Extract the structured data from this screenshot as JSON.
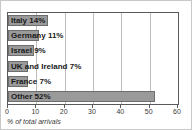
{
  "chart_data": {
    "type": "bar",
    "orientation": "horizontal",
    "title": "",
    "xlabel": "% of total arrivals",
    "ylabel": "",
    "xlim": [
      0,
      60
    ],
    "ylim": null,
    "grid": true,
    "legend": false,
    "categories": [
      "Italy",
      "Germany",
      "Israel",
      "UK and Ireland",
      "France",
      "Other"
    ],
    "values": [
      14,
      11,
      9,
      7,
      7,
      52
    ],
    "data_labels": [
      "Italy 14%",
      "Germany 11%",
      "Israel 9%",
      "UK and Ireland 7%",
      "France 7%",
      "Other 52%"
    ],
    "xticks": [
      0,
      10,
      20,
      30,
      40,
      50,
      60
    ],
    "xtick_labels": [
      "0",
      "10",
      "20",
      "30",
      "40",
      "50",
      "60"
    ],
    "bar_color": "#9a9a9a",
    "bar_edge_color": "#6e6e6e",
    "grid_color": "#bcbcbc",
    "axis_color": "#5a5a5a",
    "background": "#ffffff",
    "label_color": "#1a1a1a"
  }
}
